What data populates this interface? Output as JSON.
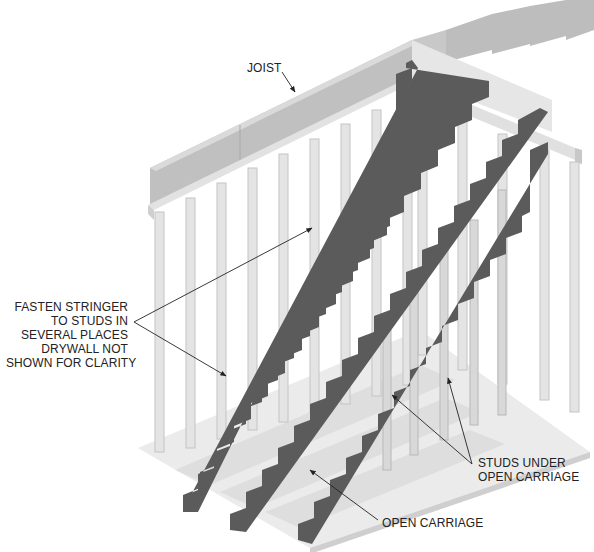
{
  "figure": {
    "colors": {
      "background": "#ffffff",
      "stringer": "#5b5b5b",
      "stringer_edge": "#7a7a7a",
      "stud": "#e4e4e4",
      "stud_shade": "#c4c4c4",
      "joist": "#bdbdbd",
      "joist_top": "#d8d8d8",
      "floor": "#e9e9e9",
      "floor_shadow": "#d2d2d2",
      "leader": "#222222",
      "text": "#222222"
    }
  },
  "labels": {
    "joist": "JOIST",
    "fasten": [
      "FASTEN STRINGER",
      "TO STUDS IN",
      "SEVERAL PLACES",
      "DRYWALL NOT",
      "SHOWN FOR CLARITY"
    ],
    "studs_under": [
      "STUDS UNDER",
      "OPEN CARRIAGE"
    ],
    "open_carriage": "OPEN CARRIAGE"
  }
}
